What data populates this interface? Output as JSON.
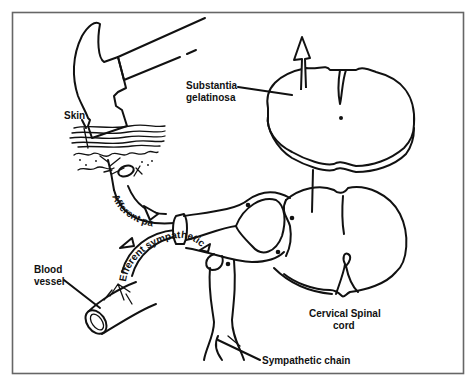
{
  "figure": {
    "type": "anatomical pain pathway diagram",
    "frame_color": "#666666",
    "line_color": "#111111",
    "background": "#ffffff"
  },
  "labels": {
    "skin": "Skin",
    "substantia_line1": "Substantia",
    "substantia_line2": "gelatinosa",
    "afferent_pain": "Afferent pain",
    "efferent_sympathetic": "Efferent sympathetic",
    "blood_line1": "Blood",
    "blood_line2": "vessel",
    "cervical_line1": "Cervical Spinal",
    "cervical_line2": "cord",
    "sympathetic_chain": "Sympathetic chain"
  },
  "elements": [
    {
      "name": "hammer",
      "icon": "hammer-icon"
    },
    {
      "name": "skin-layers",
      "icon": "skin-icon"
    },
    {
      "name": "nerve-endings",
      "icon": "nerve-ending-icon"
    },
    {
      "name": "upper-spinal-cord-section",
      "icon": "spinal-cord-cross-section-icon"
    },
    {
      "name": "ascending-arrow",
      "icon": "arrow-up-icon"
    },
    {
      "name": "lower-spinal-cord-section",
      "icon": "spinal-cord-cross-section-icon"
    },
    {
      "name": "dorsal-root-ganglion",
      "icon": "ganglion-icon"
    },
    {
      "name": "blood-vessel",
      "icon": "blood-vessel-icon"
    },
    {
      "name": "sympathetic-chain",
      "icon": "sympathetic-chain-icon"
    }
  ]
}
